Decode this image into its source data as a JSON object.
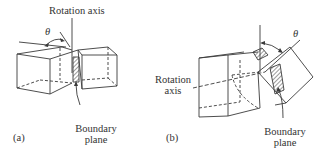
{
  "diagram_a": {
    "panel_label": "(a)",
    "angle_symbol": "θ",
    "axis_label": "Rotation axis",
    "boundary_label_line1": "Boundary",
    "boundary_label_line2": "plane"
  },
  "diagram_b": {
    "panel_label": "(b)",
    "angle_symbol": "θ",
    "axis_label_line1": "Rotation",
    "axis_label_line2": "axis",
    "boundary_label_line1": "Boundary",
    "boundary_label_line2": "plane"
  },
  "colors": {
    "line": "#3a3a3a",
    "background": "#ffffff"
  }
}
